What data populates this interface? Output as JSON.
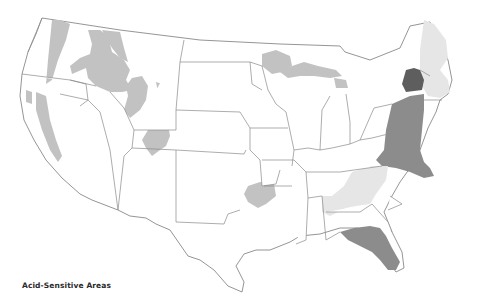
{
  "map": {
    "title": "Acid-Sensitive Areas",
    "region": "Contiguous United States",
    "legend_classes": [
      {
        "name": "light",
        "color": "#e6e6e6"
      },
      {
        "name": "medium",
        "color": "#c2c2c2"
      },
      {
        "name": "dark",
        "color": "#8c8c8c"
      },
      {
        "name": "darkest",
        "color": "#5e5e5e"
      }
    ],
    "shaded_regions": [
      {
        "name": "Cascades (WA/OR)",
        "class": "medium"
      },
      {
        "name": "Sierra Nevada (CA)",
        "class": "medium"
      },
      {
        "name": "Idaho / Montana Rockies",
        "class": "medium"
      },
      {
        "name": "Wyoming Rockies",
        "class": "medium"
      },
      {
        "name": "Colorado Rockies",
        "class": "medium"
      },
      {
        "name": "Ouachita Mountains (OK/AR)",
        "class": "medium"
      },
      {
        "name": "Upper Great Lakes (MN/WI/MI)",
        "class": "medium"
      },
      {
        "name": "New England",
        "class": "light"
      },
      {
        "name": "Southern Appalachians",
        "class": "light"
      },
      {
        "name": "Adirondacks (NY)",
        "class": "darkest"
      },
      {
        "name": "Mid-Atlantic Appalachians",
        "class": "dark"
      },
      {
        "name": "Florida / Gulf Coast",
        "class": "dark"
      }
    ]
  }
}
